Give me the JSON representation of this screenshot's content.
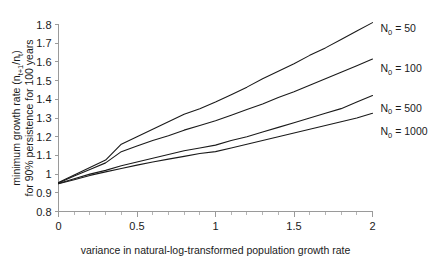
{
  "chart_data": {
    "type": "line",
    "title": "",
    "xlabel": "variance in natural-log-transformed population growth rate",
    "ylabel_line1": "minimum growth rate (n",
    "ylabel_line1_sub1": "t+1",
    "ylabel_line1_mid": "/n",
    "ylabel_line1_sub2": "t",
    "ylabel_line1_end": ")",
    "ylabel_line2": "for 90% persistence for 100 years",
    "ylabel_full": "minimum growth rate (nt+1/nt) for 90% persistence for 100 years",
    "xlim": [
      0,
      2
    ],
    "ylim": [
      0.8,
      1.8
    ],
    "xticks": [
      0,
      0.5,
      1,
      1.5,
      2
    ],
    "xticklabels": [
      "0",
      "0.5",
      "1",
      "1.5",
      "2"
    ],
    "xminor_step": 0.1,
    "yticks": [
      0.8,
      0.9,
      1.0,
      1.1,
      1.2,
      1.3,
      1.4,
      1.5,
      1.6,
      1.7,
      1.8
    ],
    "yticklabels": [
      "0.8",
      "0.9",
      "1",
      "1.1",
      "1.2",
      "1.3",
      "1.4",
      "1.5",
      "1.6",
      "1.7",
      "1.8"
    ],
    "grid": false,
    "legend_position": "right-inline-labels",
    "x": [
      0,
      0.1,
      0.2,
      0.3,
      0.4,
      0.5,
      0.6,
      0.7,
      0.8,
      0.9,
      1.0,
      1.1,
      1.2,
      1.3,
      1.4,
      1.5,
      1.6,
      1.7,
      1.8,
      1.9,
      2.0
    ],
    "series": [
      {
        "name": "N0 = 50",
        "label_prefix": "N",
        "label_sub": "0",
        "label_suffix": " = 50",
        "values": [
          0.955,
          0.995,
          1.035,
          1.075,
          1.16,
          1.2,
          1.24,
          1.28,
          1.32,
          1.35,
          1.385,
          1.425,
          1.465,
          1.51,
          1.55,
          1.59,
          1.635,
          1.675,
          1.72,
          1.765,
          1.81
        ]
      },
      {
        "name": "N0 = 100",
        "label_prefix": "N",
        "label_sub": "0",
        "label_suffix": " = 100",
        "values": [
          0.953,
          0.99,
          1.025,
          1.06,
          1.12,
          1.15,
          1.18,
          1.205,
          1.235,
          1.26,
          1.285,
          1.315,
          1.345,
          1.375,
          1.41,
          1.44,
          1.475,
          1.51,
          1.545,
          1.58,
          1.615
        ]
      },
      {
        "name": "N0 = 500",
        "label_prefix": "N",
        "label_sub": "0",
        "label_suffix": " = 500",
        "values": [
          0.95,
          0.975,
          1.0,
          1.02,
          1.045,
          1.065,
          1.085,
          1.105,
          1.125,
          1.14,
          1.155,
          1.18,
          1.2,
          1.225,
          1.25,
          1.275,
          1.3,
          1.325,
          1.35,
          1.385,
          1.42
        ]
      },
      {
        "name": "N0 = 1000",
        "label_prefix": "N",
        "label_sub": "0",
        "label_suffix": " = 1000",
        "values": [
          0.948,
          0.97,
          0.993,
          1.012,
          1.03,
          1.048,
          1.065,
          1.08,
          1.095,
          1.11,
          1.12,
          1.14,
          1.16,
          1.18,
          1.2,
          1.22,
          1.24,
          1.26,
          1.28,
          1.3,
          1.325
        ]
      }
    ],
    "series_label_positions_y": [
      1.78,
      1.565,
      1.355,
      1.23
    ]
  }
}
